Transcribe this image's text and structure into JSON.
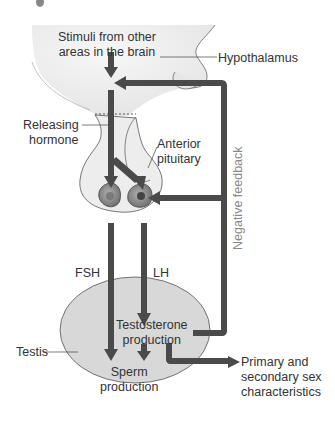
{
  "diagram": {
    "labels": {
      "stimuli": [
        "Stimuli from other",
        "areas in the brain"
      ],
      "hypothalamus": "Hypothalamus",
      "releasing_hormone": [
        "Releasing",
        "hormone"
      ],
      "anterior_pituitary": [
        "Anterior",
        "pituitary"
      ],
      "negative_feedback": "Negative feedback",
      "fsh": "FSH",
      "lh": "LH",
      "testis": "Testis",
      "testosterone_production": [
        "Testosterone",
        "production"
      ],
      "sperm_production": [
        "Sperm",
        "production"
      ],
      "characteristics": [
        "Primary and",
        "secondary sex",
        "characteristics"
      ]
    },
    "colors": {
      "arrow": "#4a4a4a",
      "brain_fill": "#ececec",
      "testis_fill": "#d8d8d8",
      "outline": "#555555",
      "cell_fill": "#8c8c8c",
      "feedback_text": "#8a8a8a"
    }
  }
}
